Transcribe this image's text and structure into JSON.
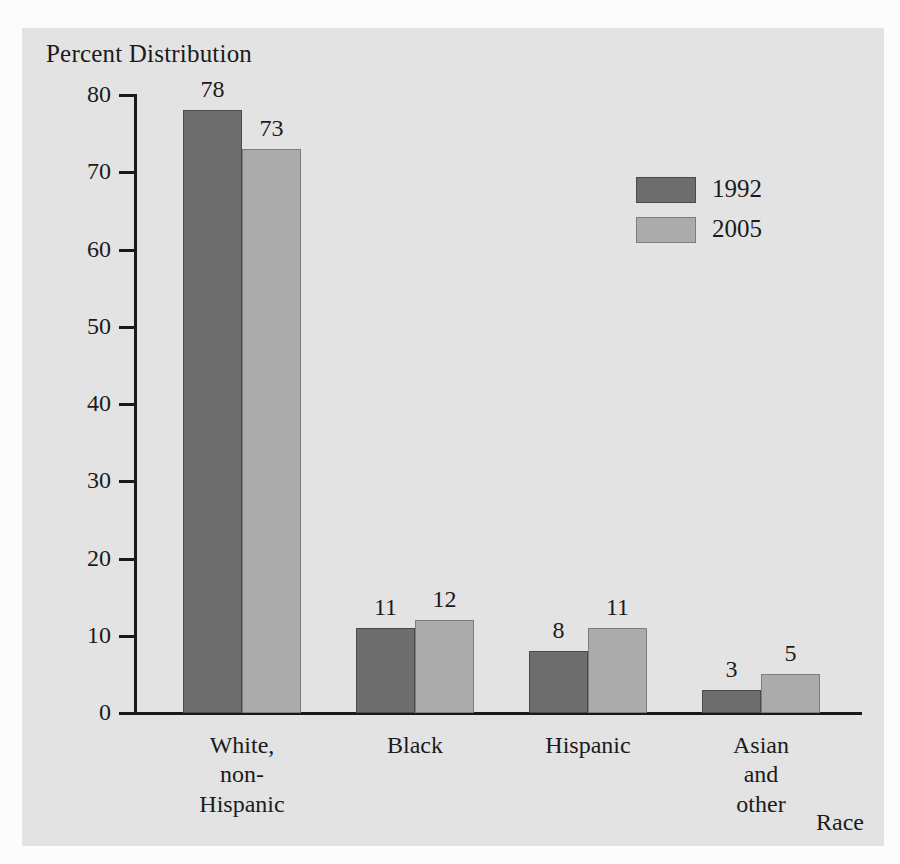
{
  "chart_data": {
    "type": "bar",
    "title": "Percent Distribution",
    "xlabel": "Race",
    "ylabel": "Percent Distribution",
    "ylim": [
      0,
      80
    ],
    "yticks": [
      0,
      10,
      20,
      30,
      40,
      50,
      60,
      70,
      80
    ],
    "ytick_labels": [
      "0",
      "10",
      "20",
      "30",
      "40",
      "50",
      "60",
      "70",
      "80"
    ],
    "grid": false,
    "legend_position": "upper-right-inside",
    "categories": [
      "White,\nnon-\nHispanic",
      "Black",
      "Hispanic",
      "Asian\nand\nother"
    ],
    "category_labels_flat": [
      "White, non-Hispanic",
      "Black",
      "Hispanic",
      "Asian and other"
    ],
    "series": [
      {
        "name": "1992",
        "color": "#6d6d6d",
        "values": [
          78,
          11,
          8,
          3
        ]
      },
      {
        "name": "2005",
        "color": "#ababab",
        "values": [
          73,
          12,
          11,
          5
        ]
      }
    ],
    "bar_labels": {
      "series_1": [
        "78",
        "11",
        "8",
        "3"
      ],
      "series_2": [
        "73",
        "12",
        "11",
        "5"
      ]
    }
  },
  "colors": {
    "page_background": "#fcfcfc",
    "panel_background": "#e3e3e3",
    "axis": "#17191a",
    "text": "#1b1b1b",
    "series_1992": "#6d6d6d",
    "series_2005": "#ababab"
  }
}
